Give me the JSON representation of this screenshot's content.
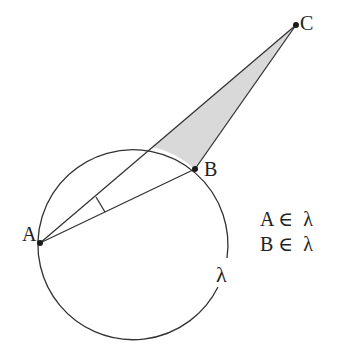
{
  "diagram": {
    "circle": {
      "name": "λ",
      "cx": 134,
      "cy": 241,
      "r": 95,
      "label": "λ"
    },
    "points": {
      "A": {
        "x": 40,
        "y": 243,
        "label": "A"
      },
      "B": {
        "x": 195,
        "y": 169,
        "label": "B"
      },
      "C": {
        "x": 296,
        "y": 25,
        "label": "C"
      }
    },
    "shaded_region": {
      "fill": "#d9d9d9"
    },
    "annotations": {
      "line1": "A ∈  λ",
      "line2": "B ∈  λ"
    },
    "colors": {
      "stroke": "#333333",
      "point": "#1a1a1a"
    }
  }
}
